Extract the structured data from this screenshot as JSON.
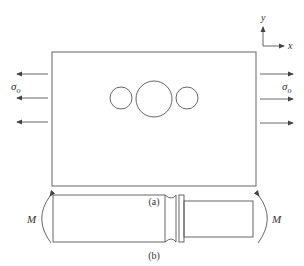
{
  "figure_a": {
    "caption": "(a)",
    "stress_label": "σ",
    "stress_subscript": "o",
    "axes": {
      "x_label": "x",
      "y_label": "y"
    }
  },
  "figure_b": {
    "caption": "(b)",
    "moment_label_left": "M",
    "moment_label_right": "M"
  },
  "colors": {
    "line": "#555555",
    "text": "#333333"
  }
}
